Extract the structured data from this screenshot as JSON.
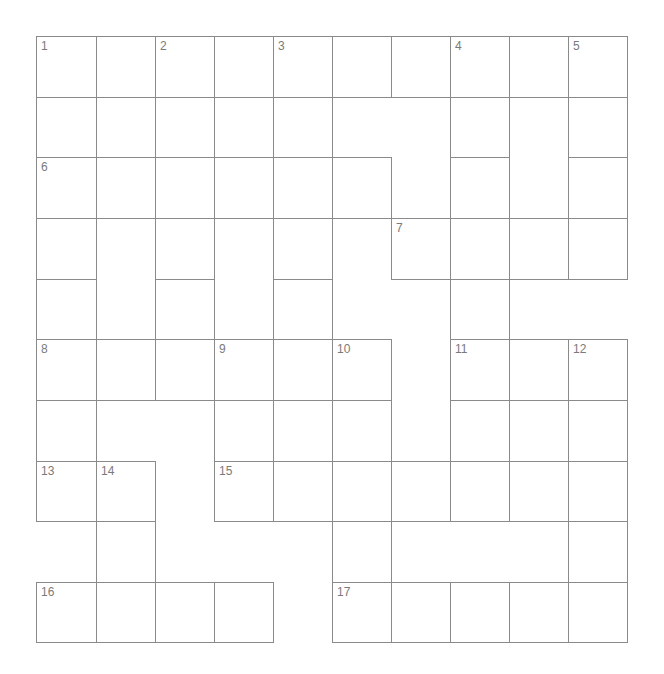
{
  "puzzle": {
    "rows": 10,
    "cols": 10,
    "grid": [
      [
        1,
        1,
        1,
        1,
        1,
        1,
        1,
        1,
        1,
        1
      ],
      [
        1,
        0,
        1,
        0,
        1,
        0,
        0,
        1,
        0,
        1
      ],
      [
        1,
        1,
        1,
        1,
        1,
        1,
        0,
        1,
        0,
        1
      ],
      [
        1,
        0,
        1,
        0,
        1,
        0,
        1,
        1,
        1,
        1
      ],
      [
        1,
        0,
        1,
        0,
        1,
        0,
        0,
        1,
        0,
        0
      ],
      [
        1,
        1,
        1,
        1,
        1,
        1,
        0,
        1,
        1,
        1
      ],
      [
        1,
        0,
        0,
        1,
        0,
        1,
        0,
        1,
        0,
        1
      ],
      [
        1,
        1,
        0,
        1,
        1,
        1,
        1,
        1,
        1,
        1
      ],
      [
        0,
        1,
        0,
        0,
        0,
        1,
        0,
        0,
        0,
        1
      ],
      [
        1,
        1,
        1,
        1,
        0,
        1,
        1,
        1,
        1,
        1
      ]
    ],
    "numbers": [
      {
        "r": 0,
        "c": 0,
        "n": "1"
      },
      {
        "r": 0,
        "c": 2,
        "n": "2"
      },
      {
        "r": 0,
        "c": 4,
        "n": "3"
      },
      {
        "r": 0,
        "c": 7,
        "n": "4"
      },
      {
        "r": 0,
        "c": 9,
        "n": "5"
      },
      {
        "r": 2,
        "c": 0,
        "n": "6"
      },
      {
        "r": 3,
        "c": 6,
        "n": "7"
      },
      {
        "r": 5,
        "c": 0,
        "n": "8"
      },
      {
        "r": 5,
        "c": 3,
        "n": "9"
      },
      {
        "r": 5,
        "c": 5,
        "n": "10"
      },
      {
        "r": 5,
        "c": 7,
        "n": "11"
      },
      {
        "r": 5,
        "c": 9,
        "n": "12"
      },
      {
        "r": 7,
        "c": 0,
        "n": "13"
      },
      {
        "r": 7,
        "c": 1,
        "n": "14"
      },
      {
        "r": 7,
        "c": 3,
        "n": "15"
      },
      {
        "r": 9,
        "c": 0,
        "n": "16"
      },
      {
        "r": 9,
        "c": 5,
        "n": "17"
      }
    ],
    "col_edges": [
      36,
      96,
      155,
      214,
      273,
      332,
      391,
      450,
      509,
      568,
      627
    ],
    "row_edges": [
      36,
      97,
      157,
      218,
      279,
      339,
      400,
      461,
      521,
      582,
      642
    ]
  }
}
